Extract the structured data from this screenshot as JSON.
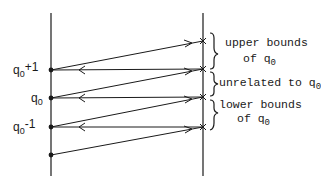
{
  "diagram": {
    "left_labels": [
      {
        "base": "q",
        "sub": "0",
        "sup": "+1",
        "y": 70
      },
      {
        "base": "q",
        "sub": "0",
        "sup": "",
        "y": 98
      },
      {
        "base": "q",
        "sub": "0",
        "sup": "-1",
        "y": 127
      }
    ],
    "brace_labels": [
      {
        "line1": "upper bounds",
        "line2": "of q",
        "line2_sub": "0"
      },
      {
        "line1": "unrelated to q",
        "line1_sub": "0",
        "line2": ""
      },
      {
        "line1": "lower bounds",
        "line2": "of q",
        "line2_sub": "0"
      }
    ],
    "left_axis": {
      "x": 51,
      "y1": 13,
      "y2": 176
    },
    "right_axis": {
      "x": 203,
      "y1": 13,
      "y2": 176
    },
    "left_points_y": [
      70,
      98,
      127,
      155
    ],
    "right_points_y": [
      41,
      69,
      97,
      127
    ],
    "colors": {
      "stroke": "#1a1a1a",
      "background": "#ffffff"
    }
  }
}
